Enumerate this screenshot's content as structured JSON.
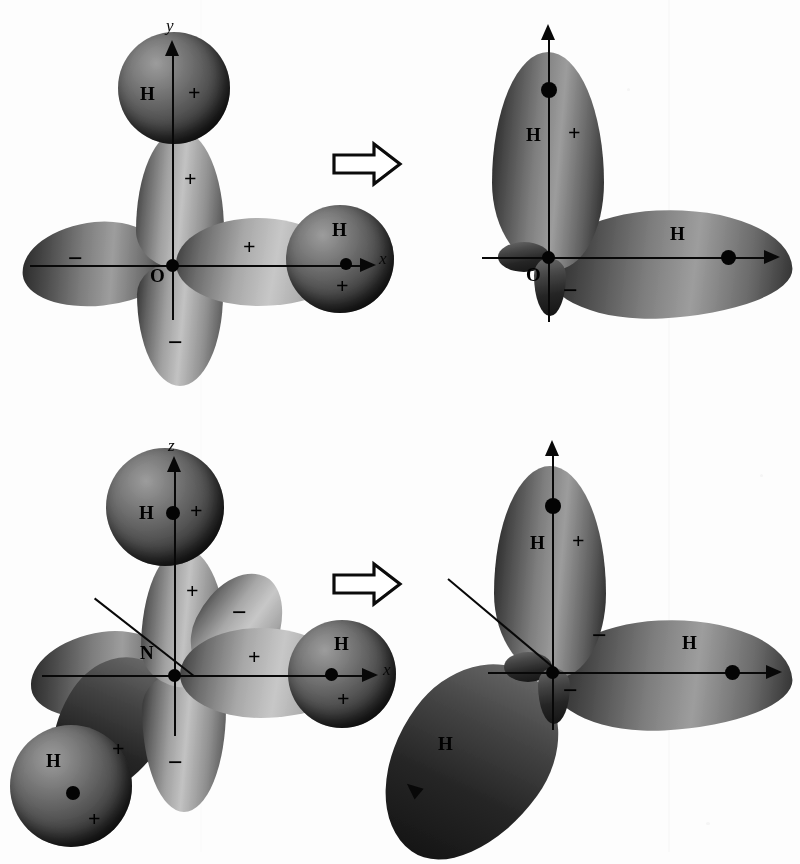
{
  "figure": {
    "background_color": "#fdfdfd",
    "ink_color": "#111111",
    "rows": [
      {
        "id": "water",
        "central_atom": "O",
        "before": {
          "center_label": "O",
          "axis_labels": {
            "vertical": "y",
            "horizontal": "x"
          },
          "hydrogens": [
            {
              "label": "H",
              "sign": "+",
              "position": "top"
            },
            {
              "label": "H",
              "sign": "+",
              "position": "right"
            }
          ],
          "orbital_signs": [
            "+",
            "+",
            "−",
            "−"
          ],
          "signs": {
            "top_lobe": "+",
            "right_lobe": "+",
            "left_lobe": "−",
            "bottom_lobe": "−"
          }
        },
        "after": {
          "center_label": "O",
          "hydrogens": [
            {
              "label": "H",
              "sign": "+",
              "position": "top"
            },
            {
              "label": "H",
              "sign": "",
              "position": "right"
            }
          ],
          "signs": {
            "top_lobe": "+",
            "small_lobe": "−"
          }
        },
        "transform_arrow": "block-arrow-right"
      },
      {
        "id": "ammonia",
        "central_atom": "N",
        "before": {
          "center_label": "N",
          "axis_labels": {
            "vertical": "z",
            "horizontal": "x"
          },
          "hydrogens": [
            {
              "label": "H",
              "sign": "+",
              "position": "top"
            },
            {
              "label": "H",
              "sign": "+",
              "position": "right"
            },
            {
              "label": "H",
              "sign": "+",
              "position": "lower-left"
            }
          ],
          "signs": {
            "top_lobe": "+",
            "right_lobe": "+",
            "diag_lobe": "−",
            "lower_left_lobe": "+",
            "bottom_lobe": "−"
          }
        },
        "after": {
          "center_label": "N",
          "hydrogens": [
            {
              "label": "H",
              "sign": "+",
              "position": "top"
            },
            {
              "label": "H",
              "sign": "",
              "position": "right"
            },
            {
              "label": "H",
              "sign": "",
              "position": "lower-left"
            }
          ],
          "signs": {
            "top_lobe": "+",
            "small_lobe_a": "−",
            "small_lobe_b": "−"
          }
        },
        "transform_arrow": "block-arrow-right"
      }
    ]
  }
}
